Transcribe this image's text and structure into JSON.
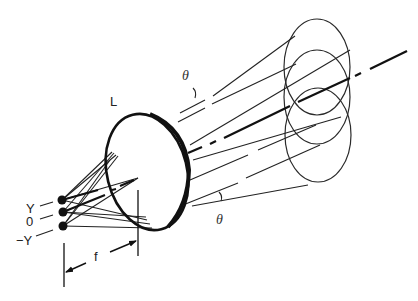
{
  "figure": {
    "type": "optics-diagram"
  },
  "labels": {
    "lens": "L",
    "focal_length": "f",
    "theta_top": "θ",
    "theta_bottom": "θ",
    "point_top": "Y",
    "point_center": "0",
    "point_bottom": "−Y"
  },
  "elements": {
    "source_points": [
      {
        "label": "Y",
        "x": 62,
        "y": 200
      },
      {
        "label": "0",
        "x": 63,
        "y": 212
      },
      {
        "label": "−Y",
        "x": 63,
        "y": 226
      }
    ],
    "lens": {
      "cx": 147,
      "cy": 172,
      "rx": 40,
      "ry": 59,
      "rotation": -14
    },
    "beam_cross_sections": [
      {
        "cx": 317,
        "cy": 67,
        "rx": 33,
        "ry": 48
      },
      {
        "cx": 317,
        "cy": 97,
        "rx": 33,
        "ry": 47
      },
      {
        "cx": 318,
        "cy": 135,
        "rx": 33,
        "ry": 47
      }
    ]
  },
  "colors": {
    "line": "#222222",
    "background": "#ffffff"
  }
}
